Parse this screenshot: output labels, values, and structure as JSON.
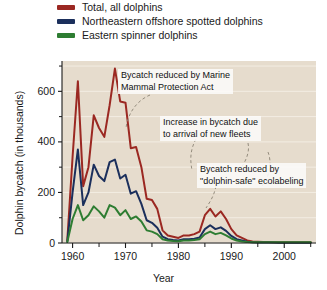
{
  "legend": {
    "items": [
      {
        "label": "Total, all dolphins",
        "color": "#9B2822",
        "key": "total"
      },
      {
        "label": "Northeastern offshore spotted dolphins",
        "color": "#1B2F5C",
        "key": "spotted"
      },
      {
        "label": "Eastern spinner dolphins",
        "color": "#2E7D32",
        "key": "spinner"
      }
    ]
  },
  "annotations": [
    {
      "name": "annotation-mmpa",
      "line1": "Bycatch reduced by Marine",
      "line2": "Mammal Protection Act"
    },
    {
      "name": "annotation-new-fleets",
      "line1": "Increase in bycatch due",
      "line2": "to arrival of new fleets"
    },
    {
      "name": "annotation-ecolabeling",
      "line1": "Bycatch reduced by",
      "line2": "\"dolphin-safe\" ecolabeling"
    }
  ],
  "chart_data": {
    "type": "line",
    "title": "",
    "xlabel": "Year",
    "ylabel": "Dolphin bycatch (in thousands)",
    "xlim": [
      1958,
      2006
    ],
    "ylim": [
      0,
      720
    ],
    "xticks": [
      1960,
      1970,
      1980,
      1990,
      2000
    ],
    "xtick_labels": [
      "1960",
      "1970",
      "1980",
      "1990",
      "2000"
    ],
    "xticks_minor": [
      1965,
      1975,
      1985,
      1995,
      2005
    ],
    "yticks": [
      0,
      200,
      400,
      600
    ],
    "ytick_labels": [
      "0",
      "200",
      "400",
      "600"
    ],
    "yticks_minor": [
      100,
      300,
      500,
      700
    ],
    "grid": true,
    "legend_position": "above-plot",
    "plot_background": "#E6DCCD",
    "gridline_color": "#F3EDE3",
    "x": [
      1959,
      1960,
      1961,
      1962,
      1963,
      1964,
      1965,
      1966,
      1967,
      1968,
      1969,
      1970,
      1971,
      1972,
      1973,
      1974,
      1975,
      1976,
      1977,
      1978,
      1979,
      1980,
      1981,
      1982,
      1983,
      1984,
      1985,
      1986,
      1987,
      1988,
      1989,
      1990,
      1991,
      1992,
      1993,
      1994,
      1995,
      1996,
      1997,
      1998,
      1999,
      2000,
      2001,
      2002,
      2003,
      2004,
      2005
    ],
    "series": [
      {
        "name": "Total, all dolphins",
        "key": "total",
        "color": "#9B2822",
        "values": [
          10,
          340,
          640,
          225,
          300,
          505,
          455,
          420,
          545,
          690,
          560,
          555,
          375,
          380,
          300,
          175,
          170,
          135,
          50,
          30,
          25,
          20,
          30,
          30,
          35,
          45,
          110,
          135,
          105,
          125,
          95,
          55,
          30,
          20,
          10,
          6,
          5,
          4,
          4,
          3,
          3,
          3,
          3,
          3,
          3,
          3,
          3
        ]
      },
      {
        "name": "Northeastern offshore spotted dolphins",
        "key": "spotted",
        "color": "#1B2F5C",
        "values": [
          5,
          200,
          370,
          150,
          200,
          310,
          265,
          245,
          320,
          330,
          255,
          270,
          195,
          205,
          155,
          90,
          80,
          60,
          25,
          15,
          12,
          10,
          15,
          15,
          17,
          22,
          55,
          70,
          55,
          62,
          48,
          28,
          15,
          10,
          5,
          3,
          2,
          2,
          2,
          2,
          1,
          1,
          1,
          1,
          1,
          1,
          1
        ]
      },
      {
        "name": "Eastern spinner dolphins",
        "key": "spinner",
        "color": "#2E7D32",
        "values": [
          4,
          95,
          150,
          90,
          110,
          145,
          125,
          100,
          150,
          140,
          110,
          130,
          95,
          105,
          85,
          50,
          45,
          35,
          15,
          10,
          8,
          7,
          10,
          10,
          12,
          15,
          35,
          45,
          35,
          40,
          30,
          18,
          10,
          6,
          4,
          3,
          3,
          3,
          3,
          3,
          3,
          3,
          3,
          3,
          3,
          3,
          3
        ]
      }
    ]
  }
}
